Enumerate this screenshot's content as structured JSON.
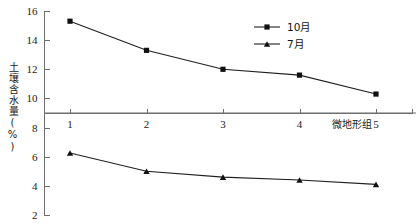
{
  "chart_data": {
    "type": "line",
    "title": "",
    "xlabel": "微地形组",
    "ylabel": "土壤含水量(%)",
    "categories": [
      "1",
      "2",
      "3",
      "4",
      "5"
    ],
    "ylim": [
      2,
      16
    ],
    "yticks": [
      "2",
      "4",
      "6",
      "8",
      "10",
      "12",
      "14",
      "16"
    ],
    "grid": false,
    "legend_position": "top-right",
    "reference_line_y": 9,
    "series": [
      {
        "name": "10月",
        "marker": "square",
        "values": [
          15.3,
          13.3,
          12.0,
          11.6,
          10.3
        ]
      },
      {
        "name": "7月",
        "marker": "triangle",
        "values": [
          6.25,
          5.0,
          4.6,
          4.4,
          4.1
        ]
      }
    ]
  },
  "legend": {
    "entries": [
      {
        "label": "10月",
        "marker": "square"
      },
      {
        "label": "7月",
        "marker": "triangle"
      }
    ]
  },
  "colors": {
    "series": "#1f1f1f",
    "axis": "#6e6e6e",
    "reference": "#b5b5b5",
    "text": "#1a1a1a"
  }
}
